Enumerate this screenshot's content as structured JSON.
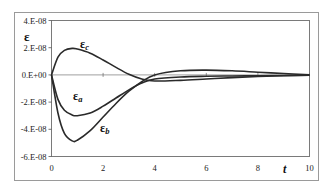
{
  "chart_data": {
    "type": "line",
    "title": "",
    "xlabel": "t",
    "ylabel": "ε",
    "xlim": [
      0,
      10
    ],
    "ylim": [
      -6e-08,
      4e-08
    ],
    "grid": false,
    "legend": "inline labels",
    "x_ticks": [
      "0",
      "2",
      "4",
      "6",
      "8",
      "10"
    ],
    "y_ticks": [
      "4.E-08",
      "2.E-08",
      "0.E+00",
      "-2.E-08",
      "-4.E-08",
      "-6.E-08"
    ],
    "x": [
      0,
      0.25,
      0.5,
      0.8,
      1.0,
      1.5,
      2.0,
      2.5,
      3.0,
      3.5,
      4.0,
      5.0,
      6.0,
      7.0,
      8.0,
      9.0,
      10.0
    ],
    "series": [
      {
        "name": "εa",
        "label_main": "ε",
        "label_sub": "a",
        "values": [
          0,
          -1.8e-08,
          -2.6e-08,
          -2.95e-08,
          -3e-08,
          -2.8e-08,
          -2.3e-08,
          -1.7e-08,
          -1.1e-08,
          -6e-09,
          -3e-09,
          -1.5e-09,
          -1e-09,
          -8e-10,
          -6e-10,
          -4e-10,
          -2e-10
        ]
      },
      {
        "name": "εb",
        "label_main": "ε",
        "label_sub": "b",
        "values": [
          0,
          -2.8e-08,
          -4.3e-08,
          -4.85e-08,
          -4.8e-08,
          -4.1e-08,
          -3.1e-08,
          -2.1e-08,
          -1.2e-08,
          -5e-09,
          0.0,
          3e-09,
          3.5e-09,
          3e-09,
          2e-09,
          1e-09,
          0.0
        ]
      },
      {
        "name": "εc",
        "label_main": "ε",
        "label_sub": "c",
        "values": [
          0,
          1.3e-08,
          1.8e-08,
          1.95e-08,
          1.9e-08,
          1.6e-08,
          1.1e-08,
          5.5e-09,
          5e-10,
          -3e-09,
          -4.5e-09,
          -4e-09,
          -3e-09,
          -2e-09,
          -1.2e-09,
          -6e-10,
          -2e-10
        ]
      }
    ]
  }
}
